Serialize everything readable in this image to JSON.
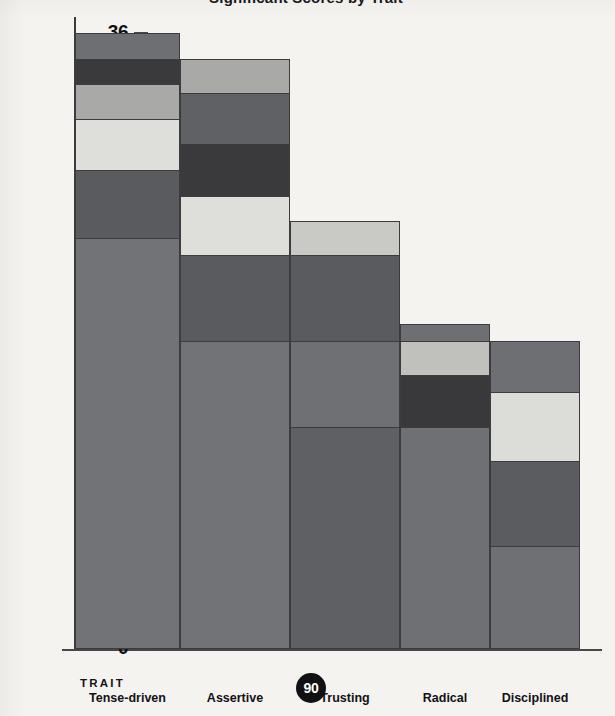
{
  "chart_data": {
    "type": "bar",
    "subtype": "stacked-bar",
    "title": "Significant Scores by Trait",
    "xlabel": "TRAIT",
    "ylabel": "Number of people with Significant Scores",
    "categories": [
      "Tense-driven",
      "Assertive",
      "Trusting",
      "Radical",
      "Disciplined"
    ],
    "ylim": [
      0,
      36
    ],
    "ytick_values": [
      0,
      4,
      8,
      12,
      16,
      20,
      24,
      28,
      32,
      36
    ],
    "ytick_labels": [
      "0",
      "4",
      "8",
      "12",
      "16",
      "20",
      "24",
      "28",
      "32",
      "36"
    ],
    "grid": false,
    "legend": null,
    "totals": [
      36,
      34.5,
      25,
      19,
      18
    ],
    "series": [
      {
        "name": "segment-1",
        "color": "#6f7073",
        "values": [
          24,
          18,
          13,
          13,
          6
        ]
      },
      {
        "name": "segment-2",
        "color": "#5a5b5e",
        "values": [
          4,
          5,
          5,
          3,
          5
        ]
      },
      {
        "name": "segment-3",
        "color": "#d6d6d2",
        "values": [
          3,
          3.5,
          2,
          0,
          4
        ]
      },
      {
        "name": "segment-4",
        "color": "#a9aaa7",
        "values": [
          2,
          3,
          0,
          2,
          0
        ]
      },
      {
        "name": "segment-5",
        "color": "#3a3a3c",
        "values": [
          1.5,
          2.5,
          0,
          0,
          0
        ]
      },
      {
        "name": "segment-6",
        "color": "#6f7073",
        "values": [
          1.5,
          2.5,
          0,
          1,
          3
        ]
      }
    ],
    "bars": [
      {
        "category": "Tense-driven",
        "total": 36,
        "segments": [
          {
            "from": 0,
            "to": 24,
            "color": "#727376"
          },
          {
            "from": 24,
            "to": 28,
            "color": "#5a5b5e"
          },
          {
            "from": 28,
            "to": 31,
            "color": "#dedfdb"
          },
          {
            "from": 31,
            "to": 33,
            "color": "#a9aaa7"
          },
          {
            "from": 33,
            "to": 34.5,
            "color": "#3a3a3c"
          },
          {
            "from": 34.5,
            "to": 36,
            "color": "#6e6f72"
          }
        ]
      },
      {
        "category": "Assertive",
        "total": 34.5,
        "segments": [
          {
            "from": 0,
            "to": 18,
            "color": "#727376"
          },
          {
            "from": 18,
            "to": 23,
            "color": "#5a5b5e"
          },
          {
            "from": 23,
            "to": 26.5,
            "color": "#dedfdb"
          },
          {
            "from": 26.5,
            "to": 29.5,
            "color": "#3a3a3c"
          },
          {
            "from": 29.5,
            "to": 32.5,
            "color": "#606164"
          },
          {
            "from": 32.5,
            "to": 34.5,
            "color": "#a9aaa7"
          }
        ]
      },
      {
        "category": "Trusting",
        "total": 25,
        "segments": [
          {
            "from": 0,
            "to": 13,
            "color": "#5f6063"
          },
          {
            "from": 13,
            "to": 18,
            "color": "#6f7073"
          },
          {
            "from": 18,
            "to": 23,
            "color": "#5a5b5e"
          },
          {
            "from": 23,
            "to": 25,
            "color": "#c9cac6"
          }
        ]
      },
      {
        "category": "Radical",
        "total": 19,
        "segments": [
          {
            "from": 0,
            "to": 13,
            "color": "#6f7073"
          },
          {
            "from": 13,
            "to": 16,
            "color": "#39393b"
          },
          {
            "from": 16,
            "to": 18,
            "color": "#c0c1bd"
          },
          {
            "from": 18,
            "to": 19,
            "color": "#6e6f72"
          }
        ]
      },
      {
        "category": "Disciplined",
        "total": 18,
        "segments": [
          {
            "from": 0,
            "to": 6,
            "color": "#6f7073"
          },
          {
            "from": 6,
            "to": 11,
            "color": "#5b5c5f"
          },
          {
            "from": 11,
            "to": 15,
            "color": "#dcdcd8"
          },
          {
            "from": 15,
            "to": 18,
            "color": "#6e6f72"
          }
        ]
      }
    ]
  },
  "axis": {
    "y_label": "Number of people with Significant Scores",
    "x_label": "TRAIT",
    "yticks": [
      "36",
      "32",
      "28",
      "24",
      "20",
      "16",
      "12",
      "8",
      "4",
      "0"
    ]
  },
  "footer": {
    "page_number": "90"
  },
  "xticks": [
    {
      "label": "Tense-driven"
    },
    {
      "label": "Assertive"
    },
    {
      "label": "Trusting"
    },
    {
      "label": "Radical"
    },
    {
      "label": "Disciplined"
    }
  ],
  "colors": {
    "background": "#f4f3f0",
    "axis": "#3b3b3d",
    "text": "#121114",
    "badge_bg": "#111012",
    "badge_text": "#ffffff"
  }
}
